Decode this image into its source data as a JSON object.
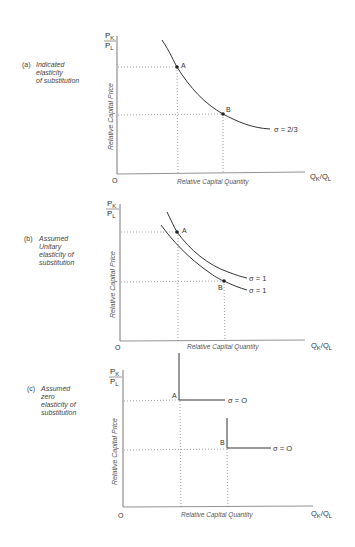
{
  "panels": [
    {
      "id": "a",
      "tag": "(a)",
      "caption_lines": [
        "Indicated",
        "elasticity",
        "of substitution"
      ],
      "y_axis_label": "Relative Capital Price",
      "x_axis_label": "Relative Capital Quantity",
      "y_ratio_num": "P",
      "y_ratio_num_sub": "K",
      "y_ratio_den": "P",
      "y_ratio_den_sub": "L",
      "x_ratio": "Q",
      "x_ratio_sub1": "K",
      "x_ratio_sep": "/Q",
      "x_ratio_sub2": "L",
      "origin": "O",
      "point_a": "A",
      "point_b": "B",
      "curve_labels": [
        "σ = 2/3"
      ]
    },
    {
      "id": "b",
      "tag": "(b)",
      "caption_lines": [
        "Assumed",
        "Unitary",
        "elasticity of",
        "substitution"
      ],
      "y_axis_label": "Relative Capital Price",
      "x_axis_label": "Relative Capital Quantity",
      "y_ratio_num": "P",
      "y_ratio_num_sub": "K",
      "y_ratio_den": "P",
      "y_ratio_den_sub": "L",
      "x_ratio": "Q",
      "x_ratio_sub1": "K",
      "x_ratio_sep": "/Q",
      "x_ratio_sub2": "L",
      "origin": "O",
      "point_a": "A",
      "point_b": "B",
      "curve_labels": [
        "σ = 1",
        "σ = 1"
      ]
    },
    {
      "id": "c",
      "tag": "(c)",
      "caption_lines": [
        "Assumed",
        "zero",
        "elasticity of",
        "substitution"
      ],
      "y_axis_label": "Relative Capital Price",
      "x_axis_label": "Relative Capital Quantity",
      "y_ratio_num": "P",
      "y_ratio_num_sub": "K",
      "y_ratio_den": "P",
      "y_ratio_den_sub": "L",
      "x_ratio": "Q",
      "x_ratio_sub1": "K",
      "x_ratio_sep": "/Q",
      "x_ratio_sub2": "L",
      "origin": "O",
      "point_a": "A",
      "point_b": "B",
      "curve_labels": [
        "σ = O",
        "σ = O"
      ]
    }
  ]
}
